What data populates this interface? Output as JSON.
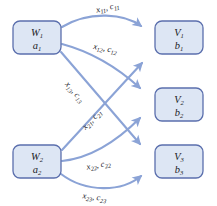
{
  "diagram": {
    "colors": {
      "node_fill": "#dde6f4",
      "node_stroke": "#5b6fad",
      "edge": "#8ba3d6",
      "background": "#ffffff",
      "text": "#15151c"
    },
    "supply_nodes": [
      {
        "id": "W1",
        "name": "W",
        "name_sub": "1",
        "value": "a",
        "value_sub": "1"
      },
      {
        "id": "W2",
        "name": "W",
        "name_sub": "2",
        "value": "a",
        "value_sub": "2"
      }
    ],
    "demand_nodes": [
      {
        "id": "V1",
        "name": "V",
        "name_sub": "1",
        "value": "b",
        "value_sub": "1"
      },
      {
        "id": "V2",
        "name": "V",
        "name_sub": "2",
        "value": "b",
        "value_sub": "2"
      },
      {
        "id": "V3",
        "name": "V",
        "name_sub": "3",
        "value": "b",
        "value_sub": "3"
      }
    ],
    "edges": [
      {
        "id": "e11",
        "from": "W1",
        "to": "V1",
        "flow": "x",
        "flow_sub": "11",
        "cost": "c",
        "cost_sub": "11",
        "separator": ", "
      },
      {
        "id": "e12",
        "from": "W1",
        "to": "V2",
        "flow": "x",
        "flow_sub": "12",
        "cost": "c",
        "cost_sub": "12",
        "separator": ", "
      },
      {
        "id": "e13",
        "from": "W1",
        "to": "V3",
        "flow": "x",
        "flow_sub": "13",
        "cost": "c",
        "cost_sub": "13",
        "separator": ", "
      },
      {
        "id": "e21",
        "from": "W2",
        "to": "V1",
        "flow": "x",
        "flow_sub": "21",
        "cost": "c",
        "cost_sub": "21",
        "separator": ", "
      },
      {
        "id": "e22",
        "from": "W2",
        "to": "V2",
        "flow": "x",
        "flow_sub": "22",
        "cost": "c",
        "cost_sub": "22",
        "separator": ", "
      },
      {
        "id": "e23",
        "from": "W2",
        "to": "V3",
        "flow": "x",
        "flow_sub": "23",
        "cost": "c",
        "cost_sub": "23",
        "separator": ", "
      }
    ]
  }
}
